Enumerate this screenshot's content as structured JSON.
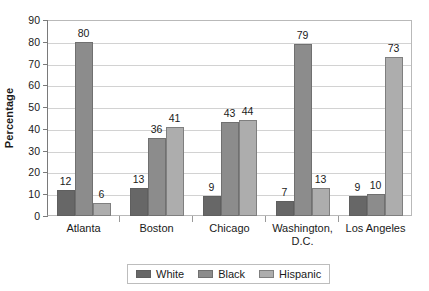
{
  "chart_data": {
    "type": "bar",
    "title": "",
    "xlabel": "",
    "ylabel": "Percentage",
    "ylim": [
      0,
      90
    ],
    "ytick_step": 10,
    "yticks": [
      90,
      80,
      70,
      60,
      50,
      40,
      30,
      20,
      10,
      0
    ],
    "grid": true,
    "legend_position": "bottom",
    "categories": [
      "Atlanta",
      "Boston",
      "Chicago",
      "Washington, D.C.",
      "Los Angeles"
    ],
    "category_lines": [
      [
        "Atlanta"
      ],
      [
        "Boston"
      ],
      [
        "Chicago"
      ],
      [
        "Washington,",
        "D.C."
      ],
      [
        "Los Angeles"
      ]
    ],
    "series": [
      {
        "name": "White",
        "color": "#676767",
        "values": [
          12,
          13,
          9,
          7,
          9
        ]
      },
      {
        "name": "Black",
        "color": "#8c8c8c",
        "values": [
          80,
          36,
          43,
          79,
          10
        ]
      },
      {
        "name": "Hispanic",
        "color": "#adadad",
        "values": [
          6,
          41,
          44,
          13,
          73
        ]
      }
    ]
  }
}
